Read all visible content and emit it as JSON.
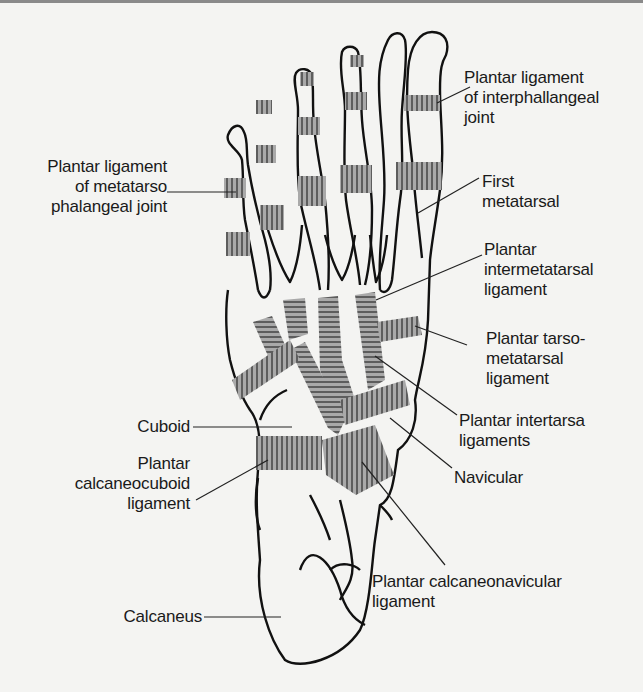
{
  "figure": {
    "colors": {
      "outline": "#111111",
      "ligament_fill": "#a9a9a9",
      "ligament_stripes": "#2a2a2a",
      "background": "#f4f4f2"
    }
  },
  "labels": {
    "interphalangeal": "Plantar ligament\nof interphallangeal\njoint",
    "metatarsophalangeal": "Plantar ligament\nof metatarso\nphalangeal joint",
    "first_metatarsal": "First\nmetatarsal",
    "intermetatarsal": "Plantar\nintermetatarsal\nligament",
    "tarsometatarsal": "Plantar tarso-\nmetatarsal\nligament",
    "intertarsal": "Plantar intertarsa\nligaments",
    "navicular": "Navicular",
    "cuboid": "Cuboid",
    "calcaneocuboid": "Plantar\ncalcaneocuboid\nligament",
    "calcaneonavicular": "Plantar calcaneonavicular\nligament",
    "calcaneus": "Calcaneus"
  }
}
